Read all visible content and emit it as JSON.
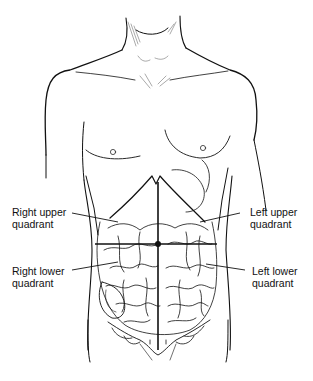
{
  "diagram": {
    "labels": {
      "right_upper": {
        "line1": "Right upper",
        "line2": "quadrant"
      },
      "left_upper": {
        "line1": "Left upper",
        "line2": "quadrant"
      },
      "right_lower": {
        "line1": "Right lower",
        "line2": "quadrant"
      },
      "left_lower": {
        "line1": "Left lower",
        "line2": "quadrant"
      }
    },
    "colors": {
      "ink": "#111111",
      "background": "#ffffff"
    }
  }
}
